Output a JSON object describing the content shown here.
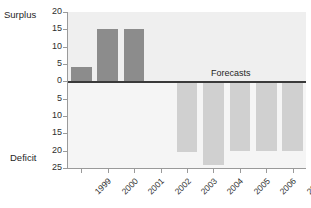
{
  "chart_data": {
    "type": "bar",
    "title": "",
    "xlabel": "",
    "ylabel": "",
    "categories": [
      "1999",
      "2000",
      "2001",
      "2002",
      "2003",
      "2004",
      "2005",
      "2006",
      "2007"
    ],
    "values": [
      4,
      15,
      15,
      0,
      -20.5,
      -24,
      -20,
      -20,
      -20
    ],
    "ylim": [
      -25,
      20
    ],
    "y_ticks": [
      20,
      15,
      10,
      5,
      0,
      5,
      10,
      15,
      20,
      25
    ],
    "y_tick_values": [
      20,
      15,
      10,
      5,
      0,
      -5,
      -10,
      -15,
      -20,
      -25
    ],
    "grid": false,
    "legend": "none",
    "axis_captions": {
      "positive": "Surplus",
      "negative": "Deficit"
    },
    "annotations": [
      {
        "text": "Forecasts",
        "start_category": "2003",
        "end_category": "2007"
      }
    ],
    "series": [
      {
        "name": "Budget balance",
        "actual_categories": [
          "1999",
          "2000",
          "2001",
          "2002"
        ],
        "forecast_categories": [
          "2003",
          "2004",
          "2005",
          "2006",
          "2007"
        ]
      }
    ]
  },
  "colors": {
    "surplus_bar": "#8c8c8c",
    "deficit_bar": "#d0d0d0",
    "zero_line": "#3a3a3a",
    "axis": "#9a9a9a",
    "plot_background_upper": "#efefef",
    "plot_background_lower": "#f5f5f5",
    "text": "#2e2e2e"
  }
}
